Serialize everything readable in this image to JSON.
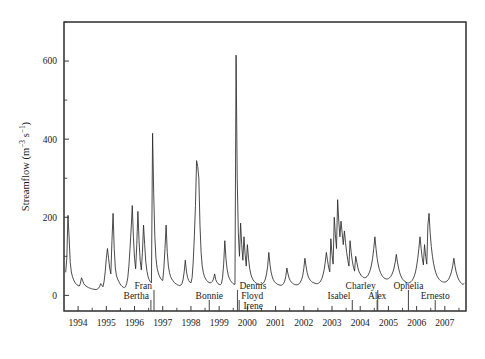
{
  "chart_data": {
    "type": "line",
    "title": "",
    "xlabel": "",
    "ylabel": "Streamflow (m",
    "ylabel_exp1": "−3",
    "ylabel_mid": " s",
    "ylabel_exp2": "−1",
    "ylabel_end": ")",
    "ylabel_full": "Streamflow (m−3 s−1)",
    "ylim": [
      -40,
      700
    ],
    "yticks": [
      0,
      200,
      400,
      600
    ],
    "yticks_minor": [
      100,
      300,
      500,
      700
    ],
    "xlim": [
      1993.5,
      2007.75
    ],
    "xticks": [
      1994,
      1995,
      1996,
      1997,
      1998,
      1999,
      2000,
      2001,
      2002,
      2003,
      2004,
      2005,
      2006,
      2007
    ],
    "xtick_labels": [
      "1994",
      "1995",
      "1996",
      "1997",
      "1998",
      "1999",
      "2000",
      "2001",
      "2002",
      "2003",
      "2004",
      "2005",
      "2006",
      "2007"
    ],
    "grid": false,
    "legend": "none",
    "line_color": "#2b2b2b",
    "frame_color": "#3a3a3a",
    "events": [
      {
        "name": "Bertha",
        "x": 1996.58,
        "label_row": 1,
        "anchor": "end"
      },
      {
        "name": "Fran",
        "x": 1996.69,
        "label_row": 0,
        "anchor": "end"
      },
      {
        "name": "Bonnie",
        "x": 1998.65,
        "label_row": 1,
        "anchor": "middle"
      },
      {
        "name": "Dennis",
        "x": 1999.65,
        "label_row": 0,
        "anchor": "start"
      },
      {
        "name": "Floyd",
        "x": 1999.71,
        "label_row": 1,
        "anchor": "start"
      },
      {
        "name": "Irene",
        "x": 1999.79,
        "label_row": 2,
        "anchor": "start"
      },
      {
        "name": "Isabel",
        "x": 2003.72,
        "label_row": 1,
        "anchor": "end"
      },
      {
        "name": "Charley",
        "x": 2004.62,
        "label_row": 0,
        "anchor": "end"
      },
      {
        "name": "Alex",
        "x": 2004.6,
        "label_row": 1,
        "anchor": "middle"
      },
      {
        "name": "Ophelia",
        "x": 2005.71,
        "label_row": 0,
        "anchor": "middle"
      },
      {
        "name": "Ernesto",
        "x": 2006.66,
        "label_row": 1,
        "anchor": "middle"
      }
    ],
    "x": [
      1993.56,
      1993.6,
      1993.64,
      1993.68,
      1993.72,
      1993.76,
      1993.8,
      1993.84,
      1993.88,
      1993.92,
      1993.96,
      1994.0,
      1994.04,
      1994.08,
      1994.12,
      1994.16,
      1994.2,
      1994.24,
      1994.28,
      1994.32,
      1994.36,
      1994.4,
      1994.44,
      1994.48,
      1994.52,
      1994.56,
      1994.6,
      1994.64,
      1994.68,
      1994.72,
      1994.76,
      1994.8,
      1994.84,
      1994.88,
      1994.92,
      1994.96,
      1995.0,
      1995.04,
      1995.08,
      1995.12,
      1995.16,
      1995.2,
      1995.24,
      1995.28,
      1995.32,
      1995.36,
      1995.4,
      1995.44,
      1995.48,
      1995.52,
      1995.56,
      1995.6,
      1995.64,
      1995.68,
      1995.72,
      1995.76,
      1995.8,
      1995.84,
      1995.88,
      1995.92,
      1995.96,
      1996.0,
      1996.04,
      1996.08,
      1996.12,
      1996.16,
      1996.2,
      1996.24,
      1996.28,
      1996.32,
      1996.36,
      1996.4,
      1996.44,
      1996.48,
      1996.52,
      1996.56,
      1996.6,
      1996.64,
      1996.68,
      1996.72,
      1996.76,
      1996.8,
      1996.84,
      1996.88,
      1996.92,
      1996.96,
      1997.0,
      1997.04,
      1997.08,
      1997.12,
      1997.16,
      1997.2,
      1997.24,
      1997.28,
      1997.32,
      1997.36,
      1997.4,
      1997.44,
      1997.48,
      1997.52,
      1997.56,
      1997.6,
      1997.64,
      1997.68,
      1997.72,
      1997.76,
      1997.8,
      1997.84,
      1997.88,
      1997.92,
      1997.96,
      1998.0,
      1998.04,
      1998.08,
      1998.12,
      1998.16,
      1998.2,
      1998.24,
      1998.28,
      1998.32,
      1998.36,
      1998.4,
      1998.44,
      1998.48,
      1998.52,
      1998.56,
      1998.6,
      1998.64,
      1998.68,
      1998.72,
      1998.76,
      1998.8,
      1998.84,
      1998.88,
      1998.92,
      1998.96,
      1999.0,
      1999.04,
      1999.08,
      1999.12,
      1999.16,
      1999.2,
      1999.24,
      1999.28,
      1999.32,
      1999.36,
      1999.4,
      1999.44,
      1999.48,
      1999.52,
      1999.56,
      1999.6,
      1999.64,
      1999.68,
      1999.72,
      1999.76,
      1999.8,
      1999.84,
      1999.88,
      1999.92,
      1999.96,
      2000.0,
      2000.04,
      2000.08,
      2000.12,
      2000.16,
      2000.2,
      2000.24,
      2000.28,
      2000.32,
      2000.36,
      2000.4,
      2000.44,
      2000.48,
      2000.52,
      2000.56,
      2000.6,
      2000.64,
      2000.68,
      2000.72,
      2000.76,
      2000.8,
      2000.84,
      2000.88,
      2000.92,
      2000.96,
      2001.0,
      2001.04,
      2001.08,
      2001.12,
      2001.16,
      2001.2,
      2001.24,
      2001.28,
      2001.32,
      2001.36,
      2001.4,
      2001.44,
      2001.48,
      2001.52,
      2001.56,
      2001.6,
      2001.64,
      2001.68,
      2001.72,
      2001.76,
      2001.8,
      2001.84,
      2001.88,
      2001.92,
      2001.96,
      2002.0,
      2002.04,
      2002.08,
      2002.12,
      2002.16,
      2002.2,
      2002.24,
      2002.28,
      2002.32,
      2002.36,
      2002.4,
      2002.44,
      2002.48,
      2002.52,
      2002.56,
      2002.6,
      2002.64,
      2002.68,
      2002.72,
      2002.76,
      2002.8,
      2002.84,
      2002.88,
      2002.92,
      2002.96,
      2003.0,
      2003.04,
      2003.08,
      2003.12,
      2003.16,
      2003.2,
      2003.24,
      2003.28,
      2003.32,
      2003.36,
      2003.4,
      2003.44,
      2003.48,
      2003.52,
      2003.56,
      2003.6,
      2003.64,
      2003.68,
      2003.72,
      2003.76,
      2003.8,
      2003.84,
      2003.88,
      2003.92,
      2003.96,
      2004.0,
      2004.04,
      2004.08,
      2004.12,
      2004.16,
      2004.2,
      2004.24,
      2004.28,
      2004.32,
      2004.36,
      2004.4,
      2004.44,
      2004.48,
      2004.52,
      2004.56,
      2004.6,
      2004.64,
      2004.68,
      2004.72,
      2004.76,
      2004.8,
      2004.84,
      2004.88,
      2004.92,
      2004.96,
      2005.0,
      2005.04,
      2005.08,
      2005.12,
      2005.16,
      2005.2,
      2005.24,
      2005.28,
      2005.32,
      2005.36,
      2005.4,
      2005.44,
      2005.48,
      2005.52,
      2005.56,
      2005.6,
      2005.64,
      2005.68,
      2005.72,
      2005.76,
      2005.8,
      2005.84,
      2005.88,
      2005.92,
      2005.96,
      2006.0,
      2006.04,
      2006.08,
      2006.12,
      2006.16,
      2006.2,
      2006.24,
      2006.28,
      2006.32,
      2006.36,
      2006.4,
      2006.44,
      2006.48,
      2006.52,
      2006.56,
      2006.6,
      2006.64,
      2006.68,
      2006.72,
      2006.76,
      2006.8,
      2006.84,
      2006.88,
      2006.92,
      2006.96,
      2007.0,
      2007.04,
      2007.08,
      2007.12,
      2007.16,
      2007.2,
      2007.24,
      2007.28,
      2007.32,
      2007.36,
      2007.4,
      2007.44,
      2007.48,
      2007.52,
      2007.56,
      2007.6,
      2007.64,
      2007.68
    ],
    "y": [
      60,
      95,
      205,
      150,
      85,
      60,
      48,
      40,
      34,
      30,
      27,
      25,
      24,
      30,
      45,
      38,
      30,
      26,
      24,
      22,
      20,
      19,
      18,
      17,
      16,
      16,
      15,
      15,
      16,
      18,
      22,
      30,
      26,
      22,
      35,
      60,
      95,
      120,
      95,
      70,
      55,
      140,
      210,
      120,
      70,
      50,
      42,
      36,
      30,
      26,
      23,
      21,
      20,
      22,
      30,
      45,
      75,
      120,
      170,
      230,
      150,
      95,
      68,
      130,
      215,
      140,
      90,
      65,
      110,
      180,
      130,
      85,
      62,
      48,
      40,
      35,
      32,
      415,
      260,
      150,
      95,
      70,
      58,
      50,
      44,
      40,
      38,
      70,
      120,
      180,
      110,
      75,
      58,
      48,
      42,
      38,
      34,
      31,
      29,
      27,
      26,
      25,
      26,
      30,
      40,
      60,
      90,
      62,
      46,
      38,
      34,
      32,
      45,
      85,
      150,
      230,
      345,
      330,
      300,
      180,
      110,
      75,
      58,
      48,
      42,
      38,
      35,
      33,
      32,
      33,
      36,
      42,
      55,
      40,
      34,
      30,
      28,
      27,
      30,
      45,
      80,
      140,
      95,
      68,
      52,
      44,
      38,
      34,
      31,
      29,
      28,
      615,
      300,
      160,
      100,
      185,
      130,
      90,
      150,
      105,
      75,
      130,
      95,
      70,
      55,
      46,
      40,
      36,
      33,
      31,
      30,
      29,
      28,
      28,
      29,
      31,
      35,
      42,
      55,
      75,
      110,
      80,
      60,
      48,
      40,
      35,
      32,
      30,
      28,
      27,
      26,
      26,
      27,
      30,
      36,
      48,
      70,
      55,
      44,
      38,
      34,
      31,
      29,
      28,
      27,
      27,
      28,
      30,
      34,
      40,
      50,
      68,
      95,
      75,
      58,
      48,
      42,
      38,
      35,
      33,
      32,
      31,
      30,
      30,
      31,
      33,
      37,
      43,
      52,
      65,
      85,
      110,
      90,
      72,
      60,
      145,
      105,
      80,
      200,
      155,
      120,
      245,
      190,
      150,
      190,
      160,
      130,
      165,
      135,
      110,
      90,
      75,
      140,
      110,
      88,
      72,
      62,
      100,
      85,
      70,
      60,
      55,
      50,
      48,
      46,
      45,
      46,
      48,
      52,
      58,
      66,
      78,
      95,
      120,
      150,
      120,
      95,
      78,
      66,
      58,
      52,
      48,
      45,
      43,
      42,
      42,
      43,
      45,
      48,
      53,
      60,
      70,
      85,
      105,
      85,
      70,
      58,
      50,
      44,
      40,
      37,
      35,
      33,
      32,
      32,
      33,
      35,
      38,
      43,
      50,
      60,
      75,
      95,
      120,
      150,
      120,
      95,
      78,
      130,
      100,
      80,
      180,
      210,
      160,
      125,
      100,
      82,
      68,
      58,
      50,
      45,
      41,
      38,
      36,
      35,
      34,
      34,
      35,
      37,
      40,
      45,
      52,
      62,
      76,
      95,
      75,
      60,
      50,
      42,
      37,
      33,
      30,
      28,
      30
    ]
  }
}
